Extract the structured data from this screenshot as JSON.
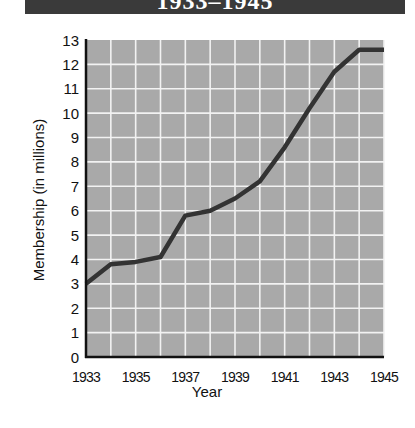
{
  "header": {
    "title": "1933–1945",
    "bar_color": "#3a3a3a"
  },
  "chart_data": {
    "type": "line",
    "title": "1933–1945",
    "xlabel": "Year",
    "ylabel": "Membership (in millions)",
    "x": [
      1933,
      1934,
      1935,
      1936,
      1937,
      1938,
      1939,
      1940,
      1941,
      1942,
      1943,
      1944,
      1945
    ],
    "series": [
      {
        "name": "Membership",
        "values": [
          3.0,
          3.8,
          3.9,
          4.1,
          5.8,
          6.0,
          6.5,
          7.2,
          8.6,
          10.2,
          11.7,
          12.6,
          12.6
        ],
        "color": "#333333"
      }
    ],
    "xticks": [
      "1933",
      "1935",
      "1937",
      "1939",
      "1941",
      "1943",
      "1945"
    ],
    "yticks": [
      "0",
      "1",
      "2",
      "3",
      "4",
      "5",
      "6",
      "7",
      "8",
      "9",
      "10",
      "11",
      "12",
      "13"
    ],
    "xlim": [
      1933,
      1945
    ],
    "ylim": [
      0,
      13
    ],
    "grid": true,
    "legend": null,
    "plot_background": "#a9a9a9",
    "grid_color": "#f2f2f2"
  }
}
